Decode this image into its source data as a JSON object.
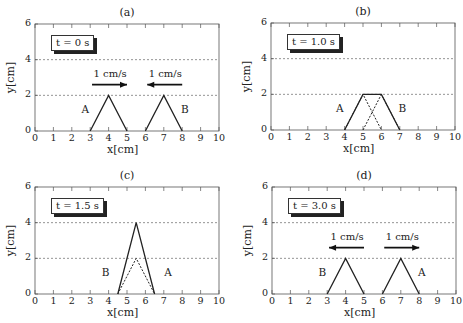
{
  "figure": {
    "panels": [
      {
        "id": "a",
        "title": "(a)",
        "time_label": "t = 0 s"
      },
      {
        "id": "b",
        "title": "(b)",
        "time_label": "t = 1.0 s"
      },
      {
        "id": "c",
        "title": "(c)",
        "time_label": "t = 1.5 s"
      },
      {
        "id": "d",
        "title": "(d)",
        "time_label": "t = 3.0 s"
      }
    ],
    "xlabel": "x[cm]",
    "ylabel": "y[cm]"
  },
  "chart_data": [
    {
      "type": "line",
      "title": "(a)",
      "annotation": "t = 0 s",
      "xlabel": "x [cm]",
      "ylabel": "y [cm]",
      "xlim": [
        0,
        10
      ],
      "ylim": [
        0,
        6
      ],
      "xticks": [
        0,
        1,
        2,
        3,
        4,
        5,
        6,
        7,
        8,
        9,
        10
      ],
      "yticks": [
        0,
        2,
        4,
        6
      ],
      "grid": {
        "y_dashed": [
          2,
          4
        ]
      },
      "series": [
        {
          "name": "A",
          "style": "solid",
          "x": [
            3,
            4,
            5
          ],
          "y": [
            0,
            2,
            0
          ]
        },
        {
          "name": "B",
          "style": "solid",
          "x": [
            6,
            7,
            8
          ],
          "y": [
            0,
            2,
            0
          ]
        }
      ],
      "labels": [
        {
          "text": "A",
          "x": 2.8,
          "y": 1.2
        },
        {
          "text": "B",
          "x": 8.2,
          "y": 1.2
        }
      ],
      "arrows": [
        {
          "text": "1 cm/s",
          "from": 3.1,
          "to": 5.0,
          "y": 2.6,
          "direction": "right"
        },
        {
          "text": "1 cm/s",
          "from": 8.0,
          "to": 6.1,
          "y": 2.6,
          "direction": "left"
        }
      ]
    },
    {
      "type": "line",
      "title": "(b)",
      "annotation": "t = 1.0 s",
      "xlabel": "x [cm]",
      "ylabel": "y [cm]",
      "xlim": [
        0,
        10
      ],
      "ylim": [
        0,
        6
      ],
      "xticks": [
        0,
        1,
        2,
        3,
        4,
        5,
        6,
        7,
        8,
        9,
        10
      ],
      "yticks": [
        0,
        2,
        4,
        6
      ],
      "grid": {
        "y_dashed": [
          2,
          4
        ]
      },
      "series": [
        {
          "name": "sum",
          "style": "solid",
          "x": [
            4,
            5,
            6,
            7
          ],
          "y": [
            0,
            2,
            2,
            0
          ]
        },
        {
          "name": "A",
          "style": "dashed",
          "x": [
            4,
            5,
            6
          ],
          "y": [
            0,
            2,
            0
          ]
        },
        {
          "name": "B",
          "style": "dashed",
          "x": [
            5,
            6,
            7
          ],
          "y": [
            0,
            2,
            0
          ]
        }
      ],
      "labels": [
        {
          "text": "A",
          "x": 3.8,
          "y": 1.2
        },
        {
          "text": "B",
          "x": 7.2,
          "y": 1.2
        }
      ],
      "arrows": []
    },
    {
      "type": "line",
      "title": "(c)",
      "annotation": "t = 1.5 s",
      "xlabel": "x [cm]",
      "ylabel": "y [cm]",
      "xlim": [
        0,
        10
      ],
      "ylim": [
        0,
        6
      ],
      "xticks": [
        0,
        1,
        2,
        3,
        4,
        5,
        6,
        7,
        8,
        9,
        10
      ],
      "yticks": [
        0,
        2,
        4,
        6
      ],
      "grid": {
        "y_dashed": [
          2,
          4
        ]
      },
      "series": [
        {
          "name": "sum",
          "style": "solid",
          "x": [
            4.5,
            5.5,
            6.5
          ],
          "y": [
            0,
            4,
            0
          ]
        },
        {
          "name": "A,B",
          "style": "dashed",
          "x": [
            4.5,
            5.5,
            6.5
          ],
          "y": [
            0,
            2,
            0
          ]
        }
      ],
      "labels": [
        {
          "text": "B",
          "x": 3.9,
          "y": 1.2
        },
        {
          "text": "A",
          "x": 7.3,
          "y": 1.2
        }
      ],
      "arrows": []
    },
    {
      "type": "line",
      "title": "(d)",
      "annotation": "t = 3.0 s",
      "xlabel": "x [cm]",
      "ylabel": "y [cm]",
      "xlim": [
        0,
        10
      ],
      "ylim": [
        0,
        6
      ],
      "xticks": [
        0,
        1,
        2,
        3,
        4,
        5,
        6,
        7,
        8,
        9,
        10
      ],
      "yticks": [
        0,
        2,
        4,
        6
      ],
      "grid": {
        "y_dashed": [
          2,
          4
        ]
      },
      "series": [
        {
          "name": "B",
          "style": "solid",
          "x": [
            3,
            4,
            5
          ],
          "y": [
            0,
            2,
            0
          ]
        },
        {
          "name": "A",
          "style": "solid",
          "x": [
            6,
            7,
            8
          ],
          "y": [
            0,
            2,
            0
          ]
        }
      ],
      "labels": [
        {
          "text": "B",
          "x": 2.8,
          "y": 1.2
        },
        {
          "text": "A",
          "x": 8.2,
          "y": 1.2
        }
      ],
      "arrows": [
        {
          "text": "1 cm/s",
          "from": 5.0,
          "to": 3.1,
          "y": 2.6,
          "direction": "left"
        },
        {
          "text": "1 cm/s",
          "from": 6.1,
          "to": 8.0,
          "y": 2.6,
          "direction": "right"
        }
      ]
    }
  ]
}
